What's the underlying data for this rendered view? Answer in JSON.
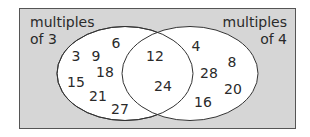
{
  "diagram": {
    "type": "venn",
    "universe_color": "#d9d9d9",
    "set_fill": "#ffffff",
    "sets": [
      {
        "label_line1": "multiples",
        "label_line2": "of 3",
        "only": [
          "3",
          "9",
          "6",
          "18",
          "15",
          "21",
          "27"
        ]
      },
      {
        "label_line1": "multiples",
        "label_line2": "of 4",
        "only": [
          "4",
          "8",
          "28",
          "20",
          "16"
        ]
      }
    ],
    "intersection": [
      "12",
      "24"
    ]
  }
}
